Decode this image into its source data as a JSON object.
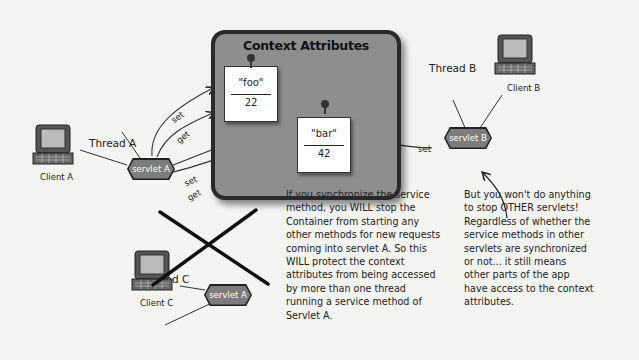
{
  "context_box": {
    "title": "Context Attributes",
    "attributes": [
      {
        "name": "\"foo\"",
        "value": "22"
      },
      {
        "name": "\"bar\"",
        "value": "42"
      }
    ]
  },
  "clients": {
    "a": "Client A",
    "b": "Client B",
    "c": "Client C"
  },
  "threads": {
    "a": "Thread A",
    "b": "Thread B",
    "c": "Thread C"
  },
  "servlets": {
    "a": "servlet A",
    "b": "servlet B",
    "c": "servlet A"
  },
  "arrows": {
    "a_foo_set": "set",
    "a_foo_get": "get",
    "a_bar_set": "set",
    "a_bar_get": "get",
    "b_bar_set": "set"
  },
  "notes": {
    "left": "If you synchronize the service\nmethod, you WILL stop the\nContainer from starting any\nother methods for new requests\ncoming into servlet A. So this\nWILL protect the context\nattributes from being accessed\nby more than one thread\nrunning a service method of\nServlet A.",
    "right": "But you won't do anything\nto stop OTHER servlets!\nRegardless of whether the\nservice methods in other\nservlets are synchronized\nor not... it still means\nother parts of the app\nhave access to the context\nattributes."
  },
  "colors": {
    "context_fill": "#8e8e8e",
    "servlet_fill": "#7c7c7c",
    "ink": "#222222",
    "background": "#f4f4f2"
  }
}
